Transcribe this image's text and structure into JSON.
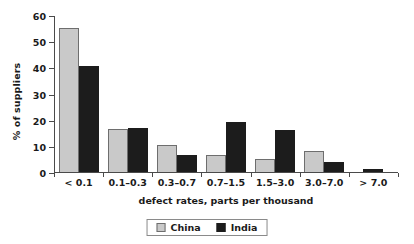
{
  "chart_data": {
    "type": "bar",
    "title": "",
    "xlabel": "defect rates, parts per thousand",
    "ylabel": "% of suppliers",
    "categories": [
      "< 0.1",
      "0.1–0.3",
      "0.3–0.7",
      "0.7–1.5",
      "1.5–3.0",
      "3.0–7.0",
      "> 7.0"
    ],
    "series": [
      {
        "name": "China",
        "color": "#c9c9c9",
        "values": [
          55,
          16.5,
          10.5,
          6.5,
          5,
          8,
          0
        ]
      },
      {
        "name": "India",
        "color": "#1c1c1c",
        "values": [
          40.5,
          17,
          6.5,
          19,
          16,
          4,
          1
        ]
      }
    ],
    "ylim": [
      0,
      60
    ],
    "yticks": [
      0,
      10,
      20,
      30,
      40,
      50,
      60
    ],
    "ytick_labels": [
      "0",
      "10",
      "20",
      "30",
      "40",
      "50",
      "60"
    ],
    "grid": false,
    "legend_position": "bottom-center"
  }
}
